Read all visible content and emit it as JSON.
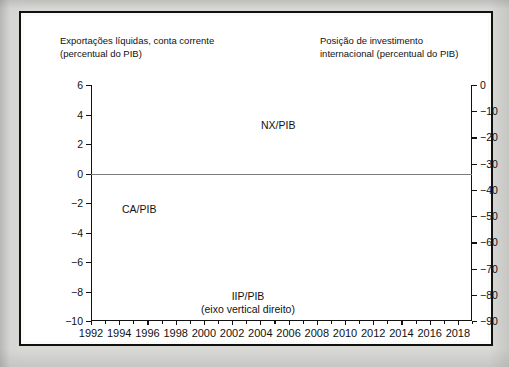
{
  "figure": {
    "left_axis_title": "Exportações líquidas, conta corrente\n(percentual do PIB)",
    "right_axis_title": "Posição de investimento\ninternacional (percentual do PIB)"
  },
  "labels": {
    "nx": "NX/PIB",
    "ca": "CA/PIB",
    "iip": "IIP/PIB\n(eixo vertical direito)"
  },
  "colors": {
    "ink": "#111111",
    "zero_line": "#7b7b7b",
    "page": "#d9d9d6",
    "plot_bg": "#ffffff"
  },
  "chart_data": {
    "type": "line",
    "title": "",
    "xlabel": "",
    "ylabel": "Exportações líquidas, conta corrente (percentual do PIB)",
    "ylabel_right": "Posição de investimento internacional (percentual do PIB)",
    "grid": false,
    "legend": "inline-annotations",
    "xlim": [
      1992,
      2019
    ],
    "ylim": [
      -10,
      6
    ],
    "ylim_right": [
      -90,
      0
    ],
    "yticks": [
      6,
      4,
      2,
      0,
      -2,
      -4,
      -6,
      -8,
      -10
    ],
    "ytick_labels": [
      "6",
      "4",
      "2",
      "0",
      "-2",
      "-4",
      "-6",
      "-8",
      "-10"
    ],
    "yticks_right": [
      0,
      -10,
      -20,
      -30,
      -40,
      -50,
      -60,
      -70,
      -80,
      -90
    ],
    "ytick_labels_right": [
      "0",
      "-10",
      "-20",
      "-30",
      "-40",
      "-50",
      "-60",
      "-70",
      "-80",
      "-90"
    ],
    "xticks": [
      1992,
      1994,
      1996,
      1998,
      2000,
      2002,
      2004,
      2006,
      2008,
      2010,
      2012,
      2014,
      2016,
      2018
    ],
    "xtick_labels": [
      "1992",
      "1994",
      "1996",
      "1998",
      "2000",
      "2002",
      "2004",
      "2006",
      "2008",
      "2010",
      "2012",
      "2014",
      "2016",
      "2018"
    ],
    "xticks_minor": [
      1993,
      1995,
      1997,
      1999,
      2001,
      2003,
      2005,
      2007,
      2009,
      2011,
      2013,
      2015,
      2017,
      2019
    ],
    "x": [
      1992,
      1993,
      1994,
      1995,
      1996,
      1997,
      1998,
      1999,
      2000,
      2001,
      2002,
      2003,
      2004,
      2005,
      2006,
      2007,
      2008,
      2009,
      2010,
      2011,
      2012,
      2013,
      2014,
      2015,
      2016,
      2017,
      2018,
      2019
    ],
    "series": [
      {
        "name": "NX/PIB",
        "axis": "left",
        "style": "dashed",
        "values": [
          3.7,
          3.1,
          3.65,
          2.85,
          2.0,
          1.6,
          1.45,
          1.35,
          0.45,
          2.2,
          3.15,
          3.55,
          3.3,
          2.4,
          0.85,
          -1.5,
          -0.75,
          0.05,
          0.1,
          -0.2,
          1.6,
          2.2,
          2.05,
          1.5,
          1.3,
          0.55,
          1.5,
          0.65
        ]
      },
      {
        "name": "CA/PIB",
        "axis": "left",
        "style": "dotted",
        "values": [
          -2.75,
          -3.1,
          -3.1,
          -3.2,
          -3.75,
          -5.1,
          -4.1,
          -3.05,
          -5.1,
          -3.1,
          -1.3,
          -1.85,
          -2.7,
          -3.6,
          -4.7,
          -6.3,
          -7.0,
          -7.6,
          -7.2,
          -7.2,
          -7.3,
          -4.1,
          -1.55,
          -2.15,
          -2.55,
          -3.8,
          -3.1,
          -2.5
        ]
      },
      {
        "name": "IIP/PIB",
        "axis": "right",
        "style": "solid",
        "values": [
          -62,
          -85,
          -83,
          -81,
          -80,
          -71,
          -77,
          -92,
          -86,
          -81,
          -75,
          -57,
          -57.5,
          -59,
          -62,
          -68,
          -70,
          -71,
          -70,
          -73,
          -91,
          -81,
          -52,
          -57,
          -62,
          -62,
          -59,
          -57
        ]
      }
    ],
    "annotations": [
      {
        "text": "NX/PIB",
        "series": "NX/PIB"
      },
      {
        "text": "CA/PIB",
        "series": "CA/PIB"
      },
      {
        "text": "IIP/PIB (eixo vertical direito)",
        "series": "IIP/PIB"
      }
    ]
  }
}
